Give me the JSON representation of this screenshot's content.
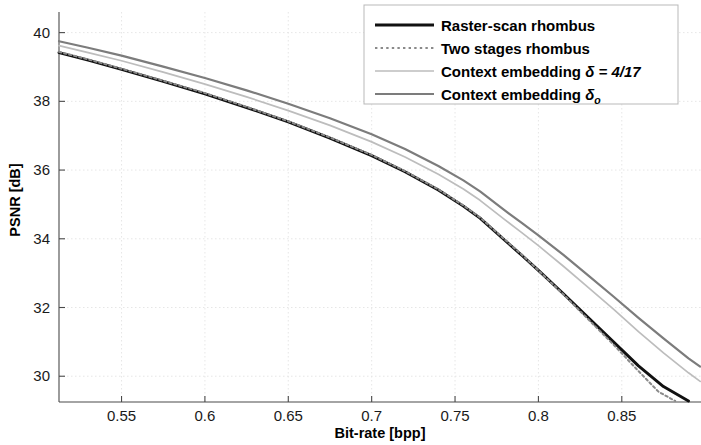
{
  "figure": {
    "background_color": "#ffffff",
    "axis_color": "#4a4a4a",
    "grid_color": "#e3e3e3"
  },
  "axes": {
    "x_title": "Bit-rate [bpp]",
    "y_title": "PSNR [dB]",
    "x_ticks": [
      "0.55",
      "0.6",
      "0.65",
      "0.7",
      "0.75",
      "0.8",
      "0.85"
    ],
    "y_ticks": [
      "30",
      "32",
      "34",
      "36",
      "38",
      "40"
    ]
  },
  "legend": {
    "items": [
      {
        "label": "Raster-scan rhombus",
        "color": "#111111",
        "style": "solid",
        "width": 2.9
      },
      {
        "label": "Two stages rhombus",
        "color": "#8a8a8a",
        "style": "dotted",
        "width": 2.0
      },
      {
        "label": "Context embedding δ = 4/17",
        "color": "#bdbdbd",
        "style": "solid",
        "width": 1.7,
        "prefix": "Context embedding ",
        "symbol": "δ",
        "suffix": " = 4/17"
      },
      {
        "label": "Context embedding δo",
        "color": "#7c7c7c",
        "style": "solid",
        "width": 2.2,
        "prefix": "Context embedding ",
        "symbol": "δ",
        "subscript": "o"
      }
    ]
  },
  "chart_data": {
    "type": "line",
    "title": "",
    "xlabel": "Bit-rate [bpp]",
    "ylabel": "PSNR [dB]",
    "xlim": [
      0.5125,
      0.8975
    ],
    "ylim": [
      29.25,
      40.6
    ],
    "xticks": [
      0.55,
      0.6,
      0.65,
      0.7,
      0.75,
      0.8,
      0.85
    ],
    "yticks": [
      30,
      32,
      34,
      36,
      38,
      40
    ],
    "grid": true,
    "legend_position": "top-right",
    "series": [
      {
        "name": "Raster-scan rhombus",
        "color": "#111111",
        "style": "solid",
        "x": [
          0.5125,
          0.53,
          0.55,
          0.575,
          0.6,
          0.625,
          0.65,
          0.675,
          0.7,
          0.72,
          0.74,
          0.755,
          0.765,
          0.78,
          0.79,
          0.8,
          0.815,
          0.83,
          0.845,
          0.86,
          0.875,
          0.89
        ],
        "y": [
          39.42,
          39.2,
          38.93,
          38.58,
          38.22,
          37.82,
          37.4,
          36.93,
          36.42,
          35.95,
          35.42,
          34.95,
          34.6,
          33.95,
          33.52,
          33.08,
          32.4,
          31.7,
          31.0,
          30.3,
          29.7,
          29.28
        ]
      },
      {
        "name": "Two stages rhombus",
        "color": "#8a8a8a",
        "style": "dotted",
        "x": [
          0.5125,
          0.53,
          0.55,
          0.575,
          0.6,
          0.625,
          0.65,
          0.675,
          0.7,
          0.72,
          0.74,
          0.755,
          0.765,
          0.78,
          0.79,
          0.8,
          0.815,
          0.83,
          0.845,
          0.86,
          0.872,
          0.882
        ],
        "y": [
          39.44,
          39.22,
          38.95,
          38.6,
          38.24,
          37.84,
          37.42,
          36.95,
          36.44,
          35.97,
          35.44,
          34.97,
          34.62,
          33.97,
          33.54,
          33.08,
          32.38,
          31.65,
          30.92,
          30.15,
          29.55,
          29.28
        ]
      },
      {
        "name": "Context embedding δ = 4/17",
        "color": "#bdbdbd",
        "style": "solid",
        "x": [
          0.5125,
          0.53,
          0.55,
          0.575,
          0.6,
          0.625,
          0.65,
          0.675,
          0.7,
          0.72,
          0.74,
          0.755,
          0.765,
          0.78,
          0.79,
          0.8,
          0.815,
          0.83,
          0.845,
          0.86,
          0.875,
          0.89,
          0.897
        ],
        "y": [
          39.62,
          39.42,
          39.18,
          38.85,
          38.5,
          38.13,
          37.73,
          37.3,
          36.82,
          36.38,
          35.88,
          35.45,
          35.12,
          34.55,
          34.18,
          33.8,
          33.2,
          32.58,
          31.95,
          31.3,
          30.68,
          30.1,
          29.85
        ]
      },
      {
        "name": "Context embedding δo",
        "color": "#7c7c7c",
        "style": "solid",
        "x": [
          0.5125,
          0.53,
          0.55,
          0.575,
          0.6,
          0.625,
          0.65,
          0.675,
          0.7,
          0.72,
          0.74,
          0.755,
          0.765,
          0.78,
          0.79,
          0.8,
          0.815,
          0.83,
          0.845,
          0.86,
          0.875,
          0.89,
          0.897
        ],
        "y": [
          39.75,
          39.56,
          39.33,
          39.01,
          38.68,
          38.32,
          37.93,
          37.51,
          37.04,
          36.61,
          36.12,
          35.7,
          35.38,
          34.82,
          34.46,
          34.1,
          33.53,
          32.93,
          32.32,
          31.7,
          31.1,
          30.52,
          30.28
        ]
      }
    ]
  }
}
